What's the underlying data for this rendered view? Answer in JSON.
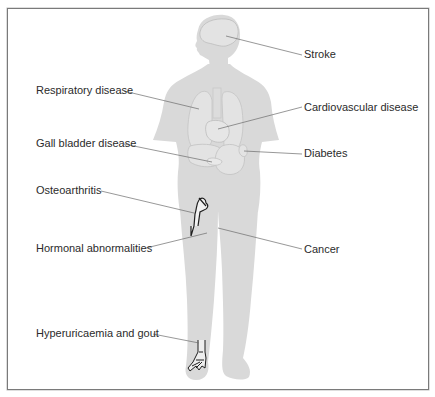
{
  "figure": {
    "type": "anatomical-diagram",
    "body_color": "#d9d9d9",
    "organ_color": "#e4e4e4",
    "organ_outline": "#c4c4c4",
    "leader_line_color": "#6b6b6b",
    "frame_color": "#7a7a7a"
  },
  "labels": {
    "stroke": "Stroke",
    "respiratory": "Respiratory disease",
    "cardiovascular": "Cardiovascular disease",
    "gall_bladder": "Gall bladder disease",
    "diabetes": "Diabetes",
    "osteoarthritis": "Osteoarthritis",
    "hormonal": "Hormonal abnormalities",
    "cancer": "Cancer",
    "gout": "Hyperuricaemia and gout"
  }
}
